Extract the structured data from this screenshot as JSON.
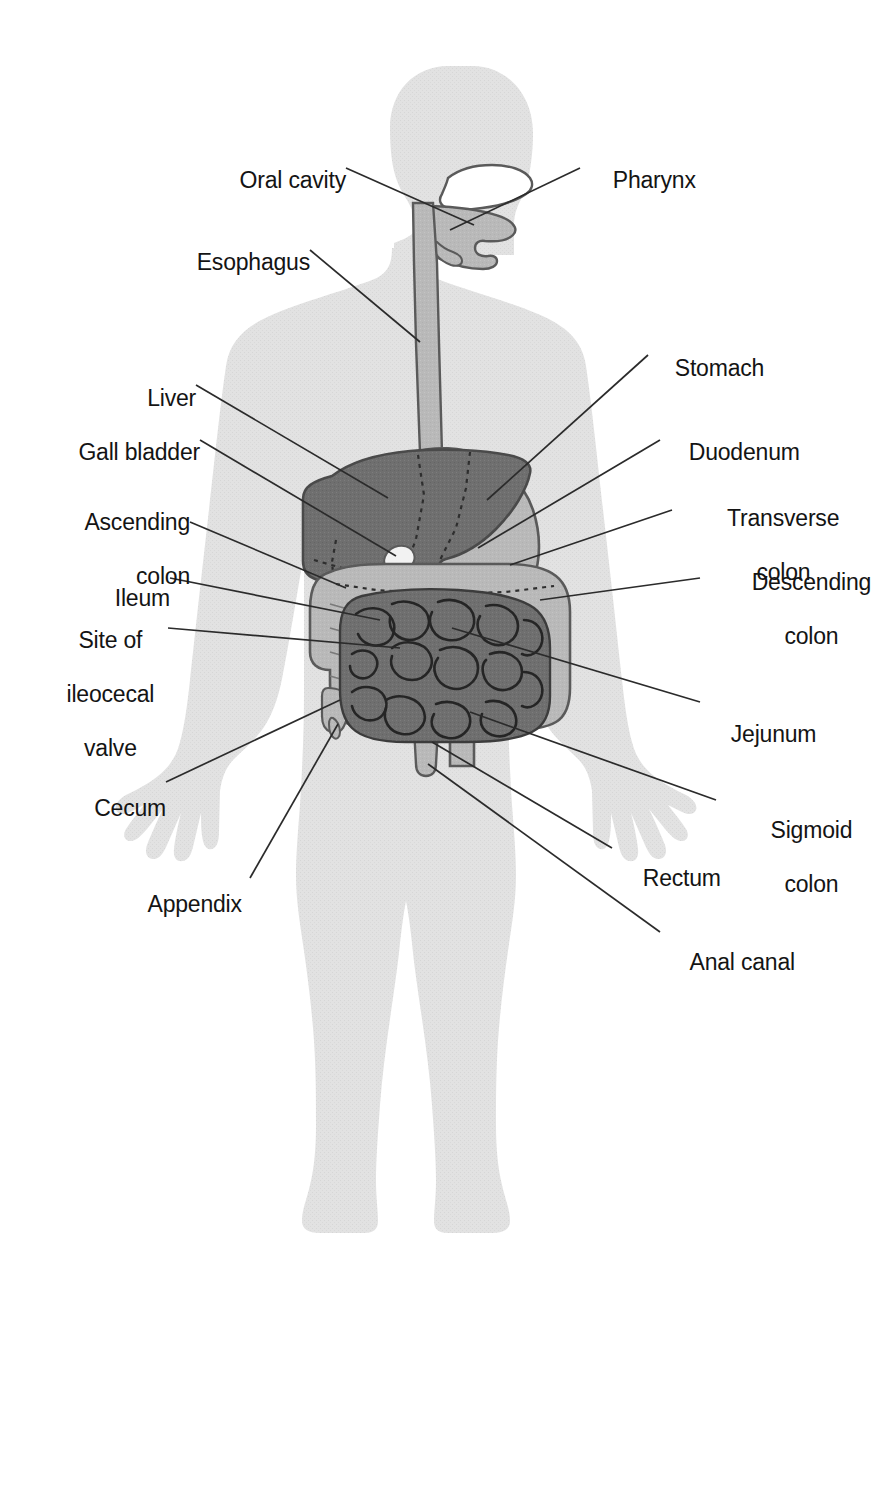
{
  "diagram": {
    "colors": {
      "background": "#ffffff",
      "body_silhouette": "#e2e2e2",
      "tract_light": "#b9b9b9",
      "organ_dark": "#6f6f6f",
      "oral_cavity": "#ffffff",
      "outline": "#4a4a4a",
      "leader_line": "#2b2b2b",
      "label_text": "#141414"
    }
  },
  "labels": {
    "left": [
      {
        "id": "oral-cavity",
        "text": "Oral cavity",
        "lines": [
          "Oral cavity"
        ]
      },
      {
        "id": "esophagus",
        "text": "Esophagus",
        "lines": [
          "Esophagus"
        ]
      },
      {
        "id": "liver",
        "text": "Liver",
        "lines": [
          "Liver"
        ]
      },
      {
        "id": "gall-bladder",
        "text": "Gall bladder",
        "lines": [
          "Gall bladder"
        ]
      },
      {
        "id": "ascending-colon",
        "text": "Ascending colon",
        "lines": [
          "Ascending",
          "colon"
        ]
      },
      {
        "id": "ileum",
        "text": "Ileum",
        "lines": [
          "Ileum"
        ]
      },
      {
        "id": "ileocecal-valve",
        "text": "Site of ileocecal valve",
        "lines": [
          "Site of",
          "ileocecal",
          "valve"
        ]
      },
      {
        "id": "cecum",
        "text": "Cecum",
        "lines": [
          "Cecum"
        ]
      },
      {
        "id": "appendix",
        "text": "Appendix",
        "lines": [
          "Appendix"
        ]
      }
    ],
    "right": [
      {
        "id": "pharynx",
        "text": "Pharynx",
        "lines": [
          "Pharynx"
        ]
      },
      {
        "id": "stomach",
        "text": "Stomach",
        "lines": [
          "Stomach"
        ]
      },
      {
        "id": "duodenum",
        "text": "Duodenum",
        "lines": [
          "Duodenum"
        ]
      },
      {
        "id": "transverse-colon",
        "text": "Transverse colon",
        "lines": [
          "Transverse",
          "colon"
        ]
      },
      {
        "id": "descending-colon",
        "text": "Descending colon",
        "lines": [
          "Descending",
          "colon"
        ]
      },
      {
        "id": "jejunum",
        "text": "Jejunum",
        "lines": [
          "Jejunum"
        ]
      },
      {
        "id": "sigmoid-colon",
        "text": "Sigmoid colon",
        "lines": [
          "Sigmoid",
          "colon"
        ]
      },
      {
        "id": "rectum",
        "text": "Rectum",
        "lines": [
          "Rectum"
        ]
      },
      {
        "id": "anal-canal",
        "text": "Anal canal",
        "lines": [
          "Anal canal"
        ]
      }
    ]
  },
  "text": {
    "oral_cavity": "Oral cavity",
    "esophagus": "Esophagus",
    "liver": "Liver",
    "gall_bladder": "Gall bladder",
    "ascending_colon_l1": "Ascending",
    "ascending_colon_l2": "colon",
    "ileum": "Ileum",
    "ileocecal_l1": "Site of",
    "ileocecal_l2": "ileocecal",
    "ileocecal_l3": "valve",
    "cecum": "Cecum",
    "appendix": "Appendix",
    "pharynx": "Pharynx",
    "stomach": "Stomach",
    "duodenum": "Duodenum",
    "transverse_colon_l1": "Transverse",
    "transverse_colon_l2": "colon",
    "descending_colon_l1": "Descending",
    "descending_colon_l2": "colon",
    "jejunum": "Jejunum",
    "sigmoid_colon_l1": "Sigmoid",
    "sigmoid_colon_l2": "colon",
    "rectum": "Rectum",
    "anal_canal": "Anal canal"
  }
}
